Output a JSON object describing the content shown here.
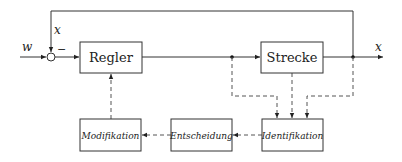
{
  "diagram": {
    "type": "block-diagram",
    "signals": {
      "reference": "w",
      "feedback": "x",
      "output": "x",
      "sign": "−"
    },
    "blocks": [
      {
        "id": "regler",
        "label": "Regler",
        "style": "upright"
      },
      {
        "id": "strecke",
        "label": "Strecke",
        "style": "upright"
      },
      {
        "id": "modifikation",
        "label": "Modifikation",
        "style": "italic"
      },
      {
        "id": "entscheidung",
        "label": "Entscheidung",
        "style": "italic"
      },
      {
        "id": "identifikation",
        "label": "Identifikation",
        "style": "italic"
      }
    ],
    "edges": [
      {
        "from": "w",
        "to": "summing-junction",
        "style": "solid"
      },
      {
        "from": "summing-junction",
        "to": "regler",
        "style": "solid"
      },
      {
        "from": "regler",
        "to": "strecke",
        "style": "solid"
      },
      {
        "from": "strecke",
        "to": "x-output",
        "style": "solid"
      },
      {
        "from": "x-output",
        "to": "summing-junction",
        "style": "solid",
        "label": "x"
      },
      {
        "from": "regler-output-branch",
        "to": "identifikation",
        "style": "dashed"
      },
      {
        "from": "strecke",
        "to": "identifikation",
        "style": "dashed"
      },
      {
        "from": "x-output",
        "to": "identifikation",
        "style": "dashed"
      },
      {
        "from": "identifikation",
        "to": "entscheidung",
        "style": "dashed"
      },
      {
        "from": "entscheidung",
        "to": "modifikation",
        "style": "dashed"
      },
      {
        "from": "modifikation",
        "to": "regler",
        "style": "dashed"
      }
    ]
  }
}
